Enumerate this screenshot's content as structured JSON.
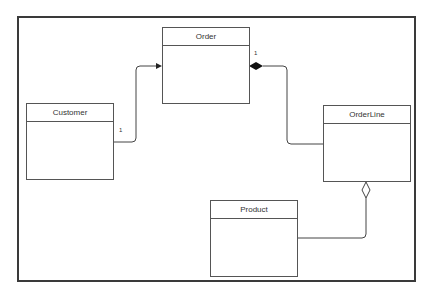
{
  "diagram": {
    "type": "UML class diagram",
    "classes": [
      {
        "name": "Order"
      },
      {
        "name": "Customer"
      },
      {
        "name": "OrderLine"
      },
      {
        "name": "Product"
      }
    ],
    "relationships": [
      {
        "from": "Customer",
        "to": "Order",
        "kind": "association",
        "arrow": "navigable",
        "multiplicity": "1"
      },
      {
        "from": "OrderLine",
        "to": "Order",
        "kind": "composition",
        "multiplicity": "1"
      },
      {
        "from": "Product",
        "to": "OrderLine",
        "kind": "aggregation"
      }
    ],
    "colors": {
      "line": "#444444",
      "background": "#ffffff"
    }
  }
}
